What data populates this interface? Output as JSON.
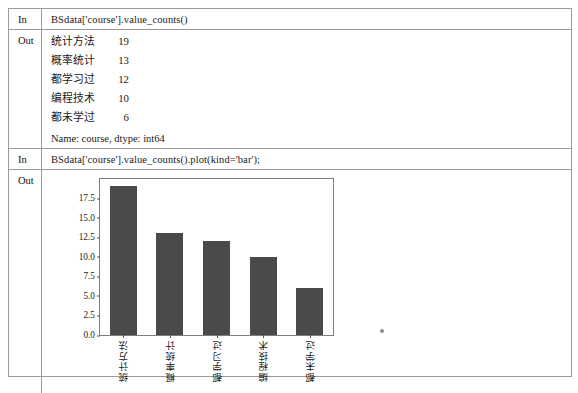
{
  "notebook": {
    "cells": [
      {
        "label": "In",
        "code": "BSdata['course'].value_counts()"
      },
      {
        "label": "Out",
        "footer": "Name: course, dtype: int64",
        "series": [
          {
            "key": "统计方法",
            "value": "19"
          },
          {
            "key": "概率统计",
            "value": "13"
          },
          {
            "key": "都学习过",
            "value": "12"
          },
          {
            "key": "编程技术",
            "value": "10"
          },
          {
            "key": "都未学过",
            "value": "6"
          }
        ]
      },
      {
        "label": "In",
        "code": "BSdata['course'].value_counts().plot(kind='bar');"
      },
      {
        "label": "Out"
      }
    ]
  },
  "chart_data": {
    "type": "bar",
    "title": "",
    "xlabel": "",
    "ylabel": "",
    "categories": [
      "统计方法",
      "概率统计",
      "都学习过",
      "编程技术",
      "都未学过"
    ],
    "values": [
      19,
      13,
      12,
      10,
      6
    ],
    "yticks": [
      "0.0",
      "2.5",
      "5.0",
      "7.5",
      "10.0",
      "12.5",
      "15.0",
      "17.5"
    ],
    "ytick_values": [
      0.0,
      2.5,
      5.0,
      7.5,
      10.0,
      12.5,
      15.0,
      17.5
    ],
    "ylim": [
      0,
      19.95
    ],
    "grid": false,
    "legend": false,
    "bar_color": "#4a4a4a",
    "xtick_rotation": 90
  }
}
